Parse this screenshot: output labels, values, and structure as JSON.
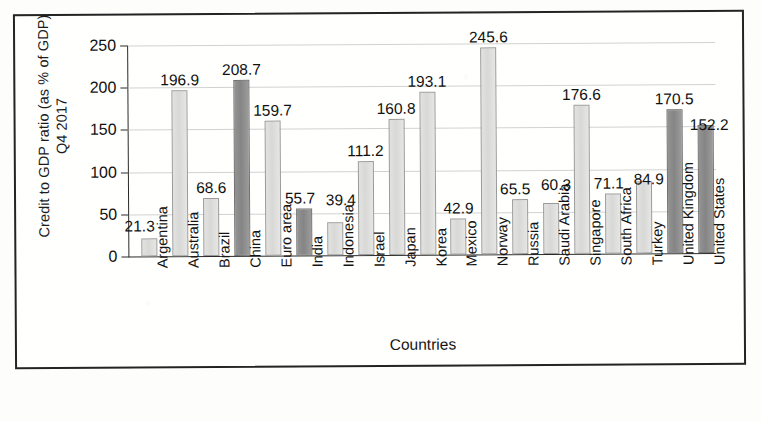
{
  "chart_data": {
    "type": "bar",
    "title": "",
    "xlabel": "Countries",
    "ylabel": "Credit to GDP ratio (as % of GDP) Q4 2017",
    "ylabel_line1": "Credit to GDP ratio (as % of GDP)",
    "ylabel_line2": "Q4 2017",
    "ylim": [
      0,
      250
    ],
    "yticks": [
      0,
      50,
      100,
      150,
      200,
      250
    ],
    "ytick_labels": [
      "0",
      "50",
      "100",
      "150",
      "200",
      "250"
    ],
    "grid": true,
    "legend": "none",
    "categories": [
      "Argentina",
      "Australia",
      "Brazil",
      "China",
      "Euro area",
      "India",
      "Indonesia",
      "Israel",
      "Japan",
      "Korea",
      "Mexico",
      "Norway",
      "Russia",
      "Saudi Arabia",
      "Singapore",
      "South Africa",
      "Turkey",
      "United Kingdom",
      "United States"
    ],
    "values": [
      21.3,
      196.9,
      68.6,
      208.7,
      159.7,
      55.7,
      39.4,
      111.2,
      160.8,
      193.1,
      42.9,
      245.6,
      65.5,
      60.3,
      176.6,
      71.1,
      84.9,
      170.5,
      152.2
    ],
    "value_labels": [
      "21.3",
      "196.9",
      "68.6",
      "208.7",
      "159.7",
      "55.7",
      "39.4",
      "111.2",
      "160.8",
      "193.1",
      "42.9",
      "245.6",
      "65.5",
      "60.3",
      "176.6",
      "71.1",
      "84.9",
      "170.5",
      "152.2"
    ],
    "bar_shades": [
      "light",
      "light",
      "light",
      "dark",
      "light",
      "dark",
      "light",
      "light",
      "light",
      "light",
      "light",
      "light",
      "light",
      "light",
      "light",
      "light",
      "light",
      "dark",
      "dark"
    ],
    "colors": {
      "light_bar": "#dedede",
      "dark_bar": "#8e8e8e",
      "bar_outline": "#8a8a8a",
      "axis": "#2a2a2a",
      "gridline": "#d2d2d2",
      "text": "#141414",
      "background": "#ffffff"
    }
  }
}
